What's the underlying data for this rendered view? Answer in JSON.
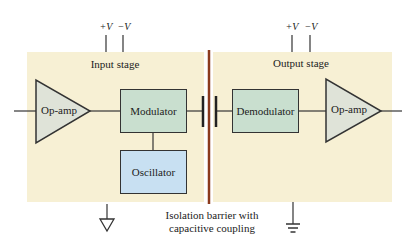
{
  "input_stage": {
    "title": "Input stage",
    "supply_plus": "+V",
    "supply_minus": "−V",
    "opamp_label": "Op-amp",
    "modulator_label": "Modulator",
    "oscillator_label": "Oscillator",
    "ground_icon": "ground-triangle-icon"
  },
  "output_stage": {
    "title": "Output stage",
    "supply_plus": "+V",
    "supply_minus": "−V",
    "demodulator_label": "Demodulator",
    "opamp_label": "Op-amp",
    "ground_icon": "earth-ground-icon"
  },
  "barrier": {
    "caption_line1": "Isolation barrier with",
    "caption_line2": "capacitive coupling"
  },
  "colors": {
    "panel_bg": "#f7f0d4",
    "block_green": "#c9dfcf",
    "block_blue": "#c8e0f2",
    "opamp_fill": "#dfe3d8",
    "barrier": "#8b3a1e"
  }
}
